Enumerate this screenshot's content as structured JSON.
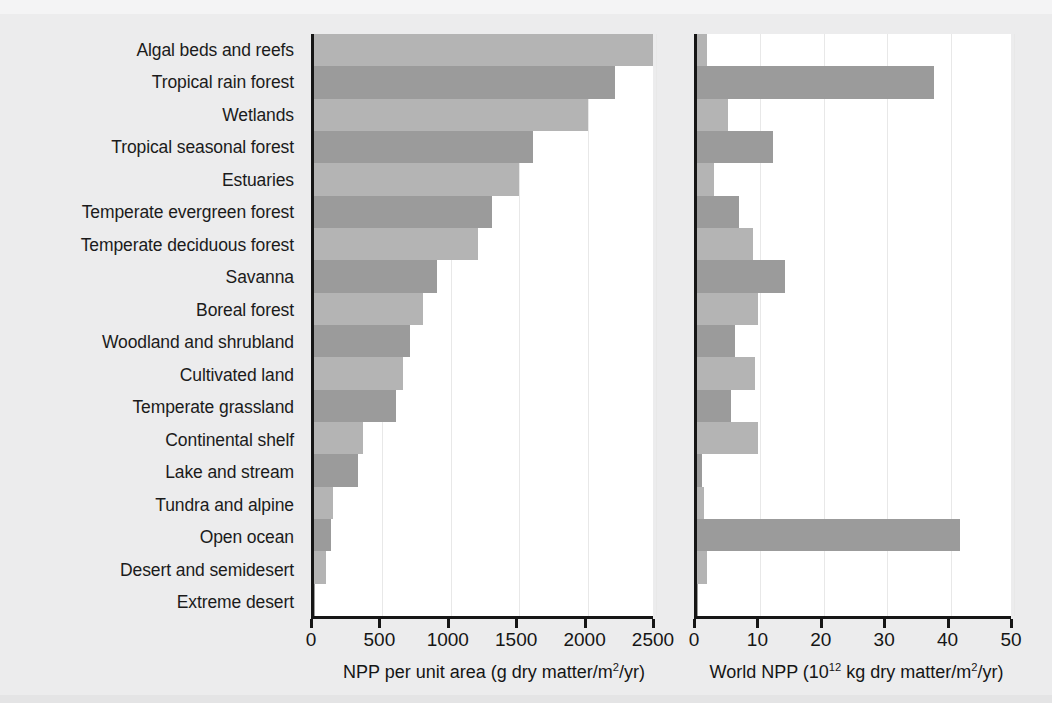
{
  "chart_data": {
    "type": "bar",
    "orientation": "horizontal",
    "title": "",
    "grid": true,
    "legend": null,
    "categories": [
      "Algal beds and reefs",
      "Tropical rain forest",
      "Wetlands",
      "Tropical seasonal forest",
      "Estuaries",
      "Temperate evergreen forest",
      "Temperate deciduous forest",
      "Savanna",
      "Boreal forest",
      "Woodland and shrubland",
      "Cultivated land",
      "Temperate grassland",
      "Continental shelf",
      "Lake and stream",
      "Tundra and alpine",
      "Open ocean",
      "Desert and semidesert",
      "Extreme desert"
    ],
    "panels": [
      {
        "id": "npp-per-unit-area",
        "xlabel": "NPP per unit area (g dry matter/m²/yr)",
        "xlabel_html": "NPP per unit area (g dry matter/m<sup>2</sup>/yr)",
        "xlim": [
          0,
          2500
        ],
        "xticks": [
          0,
          500,
          1000,
          1500,
          2000,
          2500
        ],
        "xticklabels": [
          "0",
          "500",
          "1000",
          "1500",
          "2000",
          "2500"
        ],
        "values": [
          2500,
          2200,
          2000,
          1600,
          1500,
          1300,
          1200,
          900,
          800,
          700,
          650,
          600,
          360,
          320,
          140,
          125,
          90,
          3
        ]
      },
      {
        "id": "world-npp",
        "xlabel": "World NPP (10¹² kg dry matter/m²/yr)",
        "xlabel_html": "World NPP (10<sup>12</sup> kg dry matter/m<sup>2</sup>/yr)",
        "xlim": [
          0,
          50
        ],
        "xticks": [
          0,
          10,
          20,
          30,
          40,
          50
        ],
        "xticklabels": [
          "0",
          "10",
          "20",
          "30",
          "40",
          "50"
        ],
        "values": [
          1.6,
          37.4,
          4.9,
          12.0,
          2.7,
          6.6,
          8.8,
          13.9,
          9.6,
          6.0,
          9.1,
          5.4,
          9.6,
          0.8,
          1.1,
          41.5,
          1.6,
          0.07
        ]
      }
    ],
    "colors": {
      "bar_light": "#b4b4b4",
      "bar_dark": "#9b9b9b",
      "axis": "#161616",
      "plot_background": "#ffffff",
      "figure_background": "#ececed",
      "gridline": "#e8e8e8"
    }
  }
}
